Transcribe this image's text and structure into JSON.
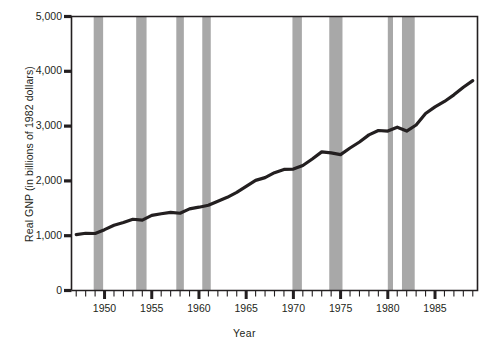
{
  "chart_data": {
    "type": "line",
    "title": "",
    "xlabel": "Year",
    "ylabel": "Real GNP (in billions of 1982 dollars)",
    "ylim": [
      0,
      5000
    ],
    "xlim": [
      1946.5,
      1989.5
    ],
    "ytick_labels": [
      "0",
      "1,000",
      "2,000",
      "3,000",
      "4,000",
      "5,000"
    ],
    "ytick_values": [
      0,
      1000,
      2000,
      3000,
      4000,
      5000
    ],
    "xtick_labels": [
      "1950",
      "1955",
      "1960",
      "1965",
      "1970",
      "1975",
      "1980",
      "1985"
    ],
    "xtick_values": [
      1950,
      1955,
      1960,
      1965,
      1970,
      1975,
      1980,
      1985
    ],
    "xminor_step": 1,
    "grid": false,
    "legend": "none",
    "line_color": "#231f20",
    "band_color": "#a8a8a8",
    "axis_color": "#231f20",
    "series": [
      {
        "name": "Real GNP",
        "x": [
          1947,
          1948,
          1949,
          1950,
          1951,
          1952,
          1953,
          1954,
          1955,
          1956,
          1957,
          1958,
          1959,
          1960,
          1961,
          1962,
          1963,
          1964,
          1965,
          1966,
          1967,
          1968,
          1969,
          1970,
          1971,
          1972,
          1973,
          1974,
          1975,
          1976,
          1977,
          1978,
          1979,
          1980,
          1981,
          1982,
          1983,
          1984,
          1985,
          1986,
          1987,
          1988,
          1989
        ],
        "values": [
          1020,
          1045,
          1040,
          1110,
          1190,
          1240,
          1300,
          1285,
          1370,
          1400,
          1425,
          1410,
          1490,
          1520,
          1555,
          1630,
          1700,
          1790,
          1900,
          2010,
          2060,
          2150,
          2210,
          2215,
          2280,
          2400,
          2530,
          2510,
          2480,
          2600,
          2710,
          2840,
          2920,
          2910,
          2980,
          2910,
          3020,
          3230,
          3350,
          3450,
          3570,
          3710,
          3830
        ]
      }
    ],
    "recession_bands": [
      {
        "label": "1948-1949 recession",
        "start": 1948.85,
        "end": 1949.85
      },
      {
        "label": "1953-1954 recession",
        "start": 1953.35,
        "end": 1954.45
      },
      {
        "label": "1957-1958 recession",
        "start": 1957.6,
        "end": 1958.4
      },
      {
        "label": "1960-1961 recession",
        "start": 1960.35,
        "end": 1961.25
      },
      {
        "label": "1969-1970 recession",
        "start": 1969.9,
        "end": 1970.9
      },
      {
        "label": "1973-1975 recession",
        "start": 1973.8,
        "end": 1975.2
      },
      {
        "label": "1980 recession",
        "start": 1980.0,
        "end": 1980.55
      },
      {
        "label": "1981-1982 recession",
        "start": 1981.5,
        "end": 1982.85
      }
    ],
    "annotations": []
  }
}
